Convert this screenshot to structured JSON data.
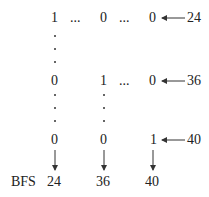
{
  "matrix": {
    "rows": [
      {
        "cells": [
          "1",
          "...",
          "0",
          "...",
          "0"
        ],
        "label": "24"
      },
      {
        "cells": [
          "0",
          "",
          "1",
          "...",
          "0"
        ],
        "label": "36"
      },
      {
        "cells": [
          "0",
          "",
          "0",
          "",
          "1"
        ],
        "label": "40"
      }
    ]
  },
  "bottom": {
    "prefix": "BFS",
    "values": [
      "24",
      "36",
      "40"
    ]
  }
}
